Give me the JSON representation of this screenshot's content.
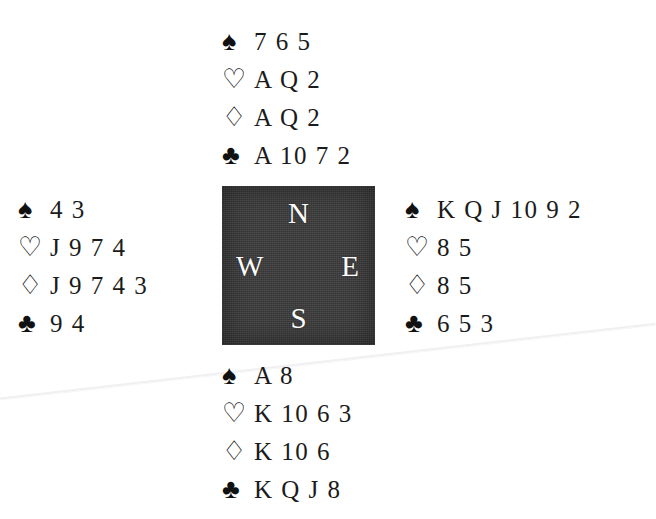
{
  "diagram": {
    "background_color": "#ffffff",
    "compass_box_color": "#3b3b3b",
    "text_color": "#1b1b1b"
  },
  "suits": {
    "spade_glyph": "♠",
    "heart_glyph": "♡",
    "diamond_glyph": "♢",
    "club_glyph": "♣"
  },
  "compass": {
    "north": "N",
    "west": "W",
    "east": "E",
    "south": "S"
  },
  "hands": {
    "north": {
      "position": "North",
      "spades": "7 6 5",
      "hearts": "A Q 2",
      "diamonds": "A Q 2",
      "clubs": "A 10 7 2"
    },
    "west": {
      "position": "West",
      "spades": "4 3",
      "hearts": "J 9 7 4",
      "diamonds": "J 9 7 4 3",
      "clubs": "9 4"
    },
    "east": {
      "position": "East",
      "spades": "K Q J 10 9 2",
      "hearts": "8 5",
      "diamonds": "8 5",
      "clubs": "6 5 3"
    },
    "south": {
      "position": "South",
      "spades": "A 8",
      "hearts": "K 10 6 3",
      "diamonds": "K 10 6",
      "clubs": "K Q J 8"
    }
  }
}
